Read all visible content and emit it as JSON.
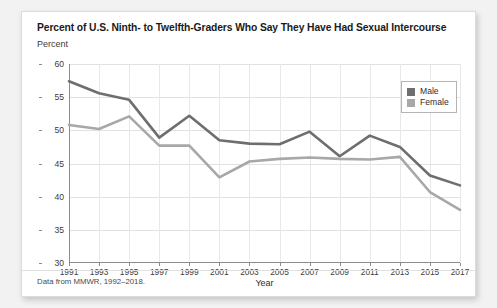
{
  "card": {
    "title": "Percent of U.S. Ninth- to Twelfth-Graders Who Say They Have Had Sexual Intercourse",
    "source_note": "Data from MMWR, 1992–2018."
  },
  "colors": {
    "male": "#6e6e6e",
    "female": "#a8a8a8",
    "grid": "#e2e2e2",
    "axis": "#8c8c8c",
    "card_background": "#ffffff",
    "page_background": "#f2f2f2"
  },
  "chart_data": {
    "type": "line",
    "title": "Percent of U.S. Ninth- to Twelfth-Graders Who Say They Have Had Sexual Intercourse",
    "xlabel": "Year",
    "ylabel": "Percent",
    "ylim": [
      30,
      60
    ],
    "yticks": [
      30,
      35,
      40,
      45,
      50,
      55,
      60
    ],
    "xlim": [
      1991,
      2017
    ],
    "categories": [
      1991,
      1993,
      1995,
      1997,
      1999,
      2001,
      2003,
      2005,
      2007,
      2009,
      2011,
      2013,
      2015,
      2017
    ],
    "xticks": [
      "1991",
      "1993",
      "1995",
      "1997",
      "1999",
      "2001",
      "2003",
      "2005",
      "2007",
      "2009",
      "2011",
      "2013",
      "2015",
      "2017"
    ],
    "grid": true,
    "legend_position": "top-right",
    "series": [
      {
        "name": "Male",
        "color": "#6e6e6e",
        "values": [
          57.4,
          55.6,
          54.6,
          48.9,
          52.2,
          48.5,
          48.0,
          47.9,
          49.8,
          46.1,
          49.2,
          47.5,
          43.2,
          41.7
        ]
      },
      {
        "name": "Female",
        "color": "#a8a8a8",
        "values": [
          50.8,
          50.2,
          52.1,
          47.7,
          47.7,
          42.9,
          45.3,
          45.7,
          45.9,
          45.7,
          45.6,
          46.0,
          40.7,
          38.0
        ]
      }
    ]
  },
  "legend": {
    "items": [
      {
        "label": "Male",
        "color": "#6e6e6e"
      },
      {
        "label": "Female",
        "color": "#a8a8a8"
      }
    ]
  }
}
